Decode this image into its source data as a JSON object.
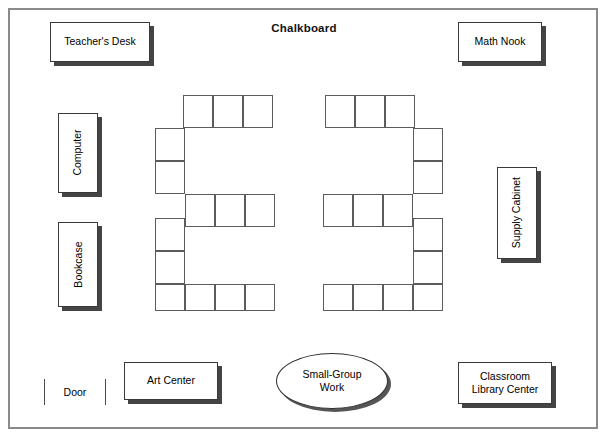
{
  "diagram": {
    "title_label": "Chalkboard",
    "width": 608,
    "height": 442,
    "stroke_color": "#5c5c5c",
    "wall_color": "#8a8a8a",
    "shadow_color": "#444444"
  },
  "furniture": [
    {
      "id": "teachers-desk",
      "label": "Teacher's Desk",
      "rotated": false
    },
    {
      "id": "math-nook",
      "label": "Math Nook",
      "rotated": false
    },
    {
      "id": "computer",
      "label": "Computer",
      "rotated": true
    },
    {
      "id": "bookcase",
      "label": "Bookcase",
      "rotated": true
    },
    {
      "id": "supply-cabinet",
      "label": "Supply Cabinet",
      "rotated": true
    },
    {
      "id": "art-center",
      "label": "Art Center",
      "rotated": false
    },
    {
      "id": "classroom-library",
      "label": "Classroom\nLibrary Center",
      "rotated": false
    }
  ],
  "door": {
    "label": "Door"
  },
  "small_group": {
    "label": "Small-Group\nWork"
  },
  "desk_clusters": [
    {
      "id": "left-cluster",
      "shape": "E-shape",
      "cells": [
        {
          "x": 183,
          "y": 95,
          "w": 30,
          "h": 33
        },
        {
          "x": 213,
          "y": 95,
          "w": 30,
          "h": 33
        },
        {
          "x": 243,
          "y": 95,
          "w": 30,
          "h": 33
        },
        {
          "x": 155,
          "y": 128,
          "w": 30,
          "h": 33
        },
        {
          "x": 155,
          "y": 161,
          "w": 30,
          "h": 33
        },
        {
          "x": 185,
          "y": 194,
          "w": 30,
          "h": 33
        },
        {
          "x": 215,
          "y": 194,
          "w": 30,
          "h": 33
        },
        {
          "x": 245,
          "y": 194,
          "w": 30,
          "h": 33
        },
        {
          "x": 155,
          "y": 218,
          "w": 30,
          "h": 33
        },
        {
          "x": 155,
          "y": 251,
          "w": 30,
          "h": 33
        },
        {
          "x": 155,
          "y": 284,
          "w": 30,
          "h": 27
        },
        {
          "x": 185,
          "y": 284,
          "w": 30,
          "h": 27
        },
        {
          "x": 215,
          "y": 284,
          "w": 30,
          "h": 27
        },
        {
          "x": 245,
          "y": 284,
          "w": 30,
          "h": 27
        }
      ]
    },
    {
      "id": "right-cluster",
      "shape": "reverse-E-shape",
      "cells": [
        {
          "x": 325,
          "y": 95,
          "w": 30,
          "h": 33
        },
        {
          "x": 355,
          "y": 95,
          "w": 30,
          "h": 33
        },
        {
          "x": 385,
          "y": 95,
          "w": 30,
          "h": 33
        },
        {
          "x": 413,
          "y": 128,
          "w": 30,
          "h": 33
        },
        {
          "x": 413,
          "y": 161,
          "w": 30,
          "h": 33
        },
        {
          "x": 323,
          "y": 194,
          "w": 30,
          "h": 33
        },
        {
          "x": 353,
          "y": 194,
          "w": 30,
          "h": 33
        },
        {
          "x": 383,
          "y": 194,
          "w": 30,
          "h": 33
        },
        {
          "x": 413,
          "y": 218,
          "w": 30,
          "h": 33
        },
        {
          "x": 413,
          "y": 251,
          "w": 30,
          "h": 33
        },
        {
          "x": 323,
          "y": 284,
          "w": 30,
          "h": 27
        },
        {
          "x": 353,
          "y": 284,
          "w": 30,
          "h": 27
        },
        {
          "x": 383,
          "y": 284,
          "w": 30,
          "h": 27
        },
        {
          "x": 413,
          "y": 284,
          "w": 30,
          "h": 27
        }
      ]
    }
  ]
}
